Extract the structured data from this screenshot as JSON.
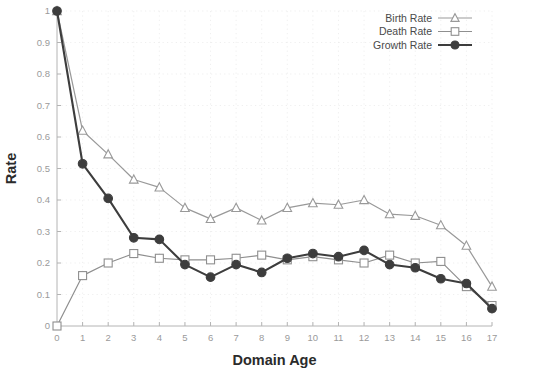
{
  "chart_data": {
    "type": "line",
    "title": "",
    "xlabel": "Domain Age",
    "ylabel": "Rate",
    "xlim": [
      0,
      17
    ],
    "ylim": [
      0,
      1
    ],
    "grid": true,
    "legend_position": "top-right",
    "x": [
      0,
      1,
      2,
      3,
      4,
      5,
      6,
      7,
      8,
      9,
      10,
      11,
      12,
      13,
      14,
      15,
      16,
      17
    ],
    "xtick_labels": [
      "0",
      "1",
      "2",
      "3",
      "4",
      "5",
      "6",
      "7",
      "8",
      "9",
      "10",
      "11",
      "12",
      "13",
      "14",
      "15",
      "16",
      "17"
    ],
    "ytick_labels": [
      "0",
      "0.1",
      "0.2",
      "0.3",
      "0.4",
      "0.5",
      "0.6",
      "0.7",
      "0.8",
      "0.9",
      "1"
    ],
    "ytick_values": [
      0,
      0.1,
      0.2,
      0.3,
      0.4,
      0.5,
      0.6,
      0.7,
      0.8,
      0.9,
      1
    ],
    "series": [
      {
        "name": "Birth Rate",
        "color": "#999999",
        "marker": "triangle",
        "marker_filled": false,
        "values": [
          1.0,
          0.62,
          0.545,
          0.465,
          0.44,
          0.375,
          0.34,
          0.375,
          0.335,
          0.375,
          0.39,
          0.385,
          0.4,
          0.355,
          0.35,
          0.32,
          0.255,
          0.125
        ]
      },
      {
        "name": "Death Rate",
        "color": "#8f8f8f",
        "marker": "square",
        "marker_filled": false,
        "values": [
          0.0,
          0.16,
          0.2,
          0.23,
          0.215,
          0.21,
          0.21,
          0.215,
          0.225,
          0.21,
          0.22,
          0.21,
          0.2,
          0.225,
          0.2,
          0.205,
          0.125,
          0.065
        ]
      },
      {
        "name": "Growth Rate",
        "color": "#3d3d3d",
        "marker": "circle",
        "marker_filled": true,
        "values": [
          1.0,
          0.515,
          0.405,
          0.28,
          0.275,
          0.195,
          0.155,
          0.195,
          0.17,
          0.215,
          0.23,
          0.22,
          0.24,
          0.195,
          0.185,
          0.15,
          0.135,
          0.055
        ]
      }
    ]
  },
  "legend": {
    "items": [
      {
        "label": "Birth Rate"
      },
      {
        "label": "Death Rate"
      },
      {
        "label": "Growth Rate"
      }
    ]
  },
  "axes": {
    "x_title": "Domain Age",
    "y_title": "Rate"
  }
}
